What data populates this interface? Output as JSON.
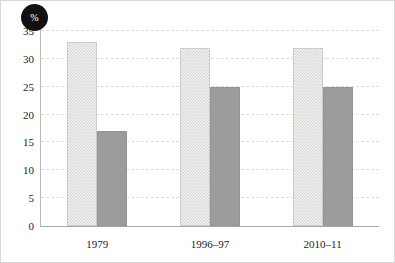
{
  "figure": {
    "unit_badge": "%",
    "badge_name": "percent-badge"
  },
  "chart_data": {
    "type": "bar",
    "title": "",
    "subtitle": "",
    "xlabel": "",
    "ylabel": "%",
    "categories": [
      "1979",
      "1996–97",
      "2010–11"
    ],
    "series": [
      {
        "name": "series-1",
        "style": "hatched",
        "color": "#f2f2f0",
        "values": [
          33,
          32,
          32
        ]
      },
      {
        "name": "series-2",
        "style": "solid",
        "color": "#9c9c9c",
        "values": [
          17,
          25,
          25
        ]
      }
    ],
    "ylim": [
      0,
      35
    ],
    "ytick_values": [
      0,
      5,
      10,
      15,
      20,
      25,
      30,
      35
    ],
    "ytick_labels": [
      "0",
      "5",
      "10",
      "15",
      "20",
      "25",
      "30",
      "35"
    ],
    "grid": "horizontal-dashed",
    "legend": "none"
  }
}
